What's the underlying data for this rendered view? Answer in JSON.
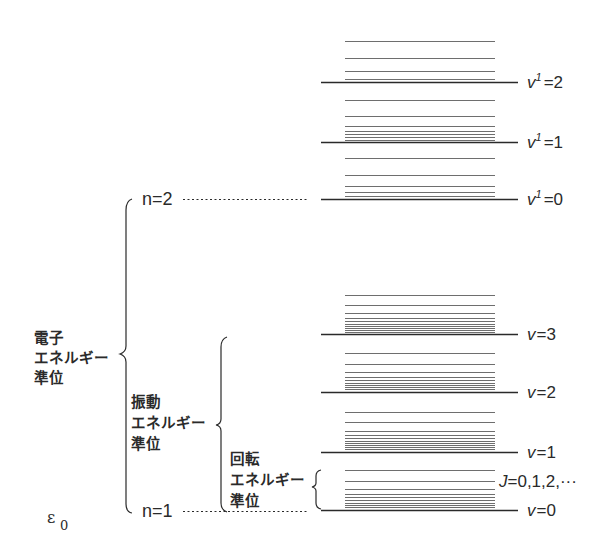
{
  "figure": {
    "colors": {
      "ink": "#2a2a2a",
      "rot_line": "#6e6e6e",
      "background": "#ffffff"
    },
    "ground_energy_label": {
      "symbol": "ε",
      "subscript": "0"
    },
    "electronic_states": [
      {
        "label": "n=2",
        "y": 199
      },
      {
        "label": "n=1",
        "y": 510
      }
    ],
    "brace_labels": {
      "electronic": [
        "電子",
        "エネルギー",
        "準位"
      ],
      "vibrational": [
        "振動",
        "エネルギー",
        "準位"
      ],
      "rotational": [
        "回転",
        "エネルギー",
        "準位"
      ]
    },
    "rotational_label": "J=0,1,2,···",
    "upper_state_vibrational_levels": [
      {
        "v_symbol": "v",
        "superscript": "1",
        "value": "=2",
        "y": 82,
        "rot_lines_y": [
          41,
          58,
          71,
          79
        ]
      },
      {
        "v_symbol": "v",
        "superscript": "1",
        "value": "=1",
        "y": 142,
        "rot_lines_y": [
          100,
          116,
          126,
          131,
          134,
          137,
          140
        ]
      },
      {
        "v_symbol": "v",
        "superscript": "1",
        "value": "=0",
        "y": 199,
        "rot_lines_y": [
          158,
          175,
          186,
          192,
          196
        ]
      }
    ],
    "lower_state_vibrational_levels": [
      {
        "v_symbol": "v",
        "value": "=3",
        "y": 334,
        "rot_lines_y": [
          295,
          305,
          313,
          318,
          321,
          324,
          326,
          328,
          330,
          332
        ]
      },
      {
        "v_symbol": "v",
        "value": "=2",
        "y": 392,
        "rot_lines_y": [
          353,
          364,
          372,
          377,
          380,
          383,
          385,
          387,
          389
        ]
      },
      {
        "v_symbol": "v",
        "value": "=1",
        "y": 452,
        "rot_lines_y": [
          412,
          422,
          431,
          435,
          438,
          441,
          443,
          445,
          447,
          449
        ]
      },
      {
        "v_symbol": "v",
        "value": "=0",
        "y": 510,
        "rot_lines_y": [
          470,
          481,
          489,
          494,
          497,
          500,
          503,
          505,
          507
        ]
      }
    ]
  }
}
